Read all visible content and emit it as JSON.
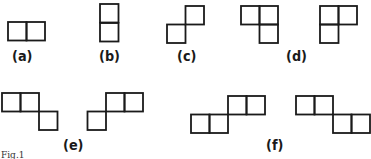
{
  "figure": {
    "caption": "Fig.1",
    "stroke_color": "#1a1a1a",
    "background": "#ffffff",
    "cell_size": 18.5,
    "groups": [
      {
        "id": "a",
        "label": "(a)",
        "label_pos": [
          12,
          49
        ],
        "shapes": [
          {
            "cells": [
              [
                8,
                22
              ],
              [
                26.5,
                22
              ]
            ]
          }
        ]
      },
      {
        "id": "b",
        "label": "(b)",
        "label_pos": [
          99,
          49
        ],
        "shapes": [
          {
            "cells": [
              [
                100,
                4
              ],
              [
                100,
                23
              ]
            ]
          }
        ]
      },
      {
        "id": "c",
        "label": "(c)",
        "label_pos": [
          177,
          49
        ],
        "shapes": [
          {
            "cells": [
              [
                167,
                24.5
              ],
              [
                185.5,
                6
              ]
            ]
          }
        ]
      },
      {
        "id": "d",
        "label": "(d)",
        "label_pos": [
          286,
          49
        ],
        "shapes": [
          {
            "cells": [
              [
                241,
                6
              ],
              [
                259.5,
                6
              ],
              [
                259.5,
                24.5
              ]
            ]
          },
          {
            "cells": [
              [
                320,
                6
              ],
              [
                338.5,
                6
              ],
              [
                320,
                24.5
              ]
            ]
          }
        ]
      },
      {
        "id": "e",
        "label": "(e)",
        "label_pos": [
          63,
          138
        ],
        "shapes": [
          {
            "cells": [
              [
                2,
                93
              ],
              [
                20.5,
                93
              ],
              [
                39,
                111.5
              ]
            ]
          },
          {
            "cells": [
              [
                106,
                93
              ],
              [
                124.5,
                93
              ],
              [
                87.5,
                111.5
              ]
            ]
          }
        ]
      },
      {
        "id": "f",
        "label": "(f)",
        "label_pos": [
          266,
          138
        ],
        "shapes": [
          {
            "cells": [
              [
                228,
                96
              ],
              [
                246.5,
                96
              ],
              [
                191,
                114.5
              ],
              [
                209.5,
                114.5
              ]
            ]
          },
          {
            "cells": [
              [
                296,
                96
              ],
              [
                314.5,
                96
              ],
              [
                333,
                114.5
              ],
              [
                351.5,
                114.5
              ]
            ]
          }
        ]
      }
    ]
  }
}
